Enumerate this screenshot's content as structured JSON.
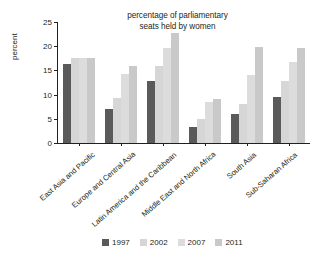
{
  "chart_data": {
    "type": "bar",
    "title": "percentage of parliamentary seats held by women",
    "title_lines": [
      "percentage of parliamentary",
      "seats held by women"
    ],
    "xlabel": "",
    "ylabel": "percent",
    "ylim": [
      0,
      25
    ],
    "yticks": [
      0,
      5,
      10,
      15,
      20,
      25
    ],
    "ytick_labels": [
      "0",
      "5",
      "10",
      "15",
      "20",
      "25"
    ],
    "grid": false,
    "legend_position": "bottom",
    "categories": [
      "East Asia and Pacific",
      "Europe and Central Asia",
      "Latin America and the Caribbean",
      "Middle East and North Africa",
      "South Asia",
      "Sub-Saharan Africa"
    ],
    "series": [
      {
        "name": "1997",
        "color": "#5a5a5a",
        "values": [
          16.4,
          7.0,
          12.9,
          3.3,
          5.9,
          9.6
        ]
      },
      {
        "name": "2002",
        "color": "#d6d6d6",
        "values": [
          17.5,
          9.4,
          15.9,
          4.9,
          8.0,
          12.8
        ]
      },
      {
        "name": "2007",
        "color": "#dcdcdc",
        "values": [
          17.6,
          14.2,
          19.7,
          8.5,
          14.1,
          16.8
        ]
      },
      {
        "name": "2011",
        "color": "#c9c9c9",
        "values": [
          17.6,
          15.9,
          22.7,
          9.1,
          19.9,
          19.6
        ]
      }
    ]
  }
}
